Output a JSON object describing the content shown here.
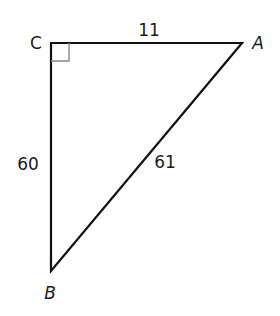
{
  "diagram": {
    "type": "right-triangle",
    "vertices": [
      {
        "name": "C",
        "x": 51,
        "y": 43,
        "label_x": 36,
        "label_y": 43,
        "right_angle": true
      },
      {
        "name": "A",
        "x": 242,
        "y": 43,
        "label_x": 258,
        "label_y": 43
      },
      {
        "name": "B",
        "x": 51,
        "y": 271,
        "label_x": 50,
        "label_y": 293
      }
    ],
    "sides": [
      {
        "from": "C",
        "to": "A",
        "length": "11",
        "label_x": 149,
        "label_y": 30
      },
      {
        "from": "C",
        "to": "B",
        "length": "60",
        "label_x": 28,
        "label_y": 164
      },
      {
        "from": "A",
        "to": "B",
        "length": "61",
        "label_x": 165,
        "label_y": 162
      }
    ],
    "right_angle_marker_size": 18,
    "line_color": "#111111",
    "marker_color": "#888888"
  }
}
